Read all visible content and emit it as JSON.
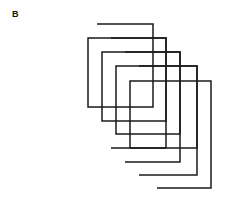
{
  "panel": {
    "label": "B",
    "background_color": "#ffffff",
    "width": 239,
    "height": 198
  },
  "figure": {
    "type": "line-drawing",
    "stroke_color": "#1a1a1a",
    "stroke_width": 1.5,
    "shape_count": 4,
    "shapes": [
      {
        "name": "spiral-1-outermost-back",
        "points": "97,24 153,24 153,107 88,107 88,38 166,38 166,148 111,148",
        "path": "M 97 24 L 153 24 L 153 107 L 88 107 L 88 38 L 166 38 L 166 148 L 111 148"
      },
      {
        "name": "spiral-2",
        "points": "111,38 166,38 166,121 102,121 102,52 180,52 180,162 125,162",
        "path": "M 111 38 L 166 38 L 166 121 L 102 121 L 102 52 L 180 52 L 180 162 L 125 162"
      },
      {
        "name": "spiral-3",
        "points": "125,52 180,52 180,134 116,134 116,66 197,66 197,175 139,175",
        "path": "M 125 52 L 180 52 L 180 134 L 116 134 L 116 66 L 197 66 L 197 175 L 139 175"
      },
      {
        "name": "spiral-4-innermost-front",
        "points": "139,66 197,66 197,148 130,148 130,81 211,81 211,188 157,188",
        "path": "M 139 66 L 197 66 L 197 148 L 130 148 L 130 81 L 211 81 L 211 188 L 157 188"
      }
    ]
  }
}
